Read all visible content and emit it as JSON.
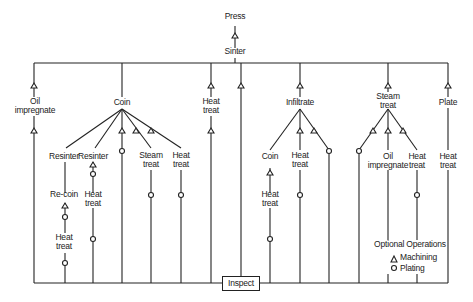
{
  "diagram": {
    "start": {
      "press": "Press",
      "sinter": "Sinter"
    },
    "end": {
      "inspect": "Inspect"
    },
    "branches": {
      "oil_impregnate": {
        "label": "Oil impregnate",
        "l1": "Oil",
        "l2": "impregnate"
      },
      "coin": {
        "label": "Coin",
        "sub": {
          "resinter_a": "Resinter",
          "recoin": "Re-coin",
          "heat_a_l1": "Heat",
          "heat_a_l2": "treat",
          "resinter_b": "Resinter",
          "heat_b_l1": "Heat",
          "heat_b_l2": "treat",
          "steam_l1": "Steam",
          "steam_l2": "treat",
          "heat_c_l1": "Heat",
          "heat_c_l2": "treat"
        }
      },
      "heat_treat": {
        "l1": "Heat",
        "l2": "treat"
      },
      "infiltrate": {
        "label": "Infiltrate",
        "sub": {
          "coin": "Coin",
          "heat_a_l1": "Heat",
          "heat_a_l2": "treat",
          "heat_b_l1": "Heat",
          "heat_b_l2": "treat"
        }
      },
      "steam_treat": {
        "l1": "Steam",
        "l2": "treat",
        "sub": {
          "oil_l1": "Oil",
          "oil_l2": "impregnate",
          "heat_l1": "Heat",
          "heat_l2": "treat"
        }
      },
      "plate": {
        "label": "Plate",
        "heat_l1": "Heat",
        "heat_l2": "treat"
      }
    },
    "legend": {
      "title": "Optional Operations",
      "machining": "Machining",
      "plating": "Plating",
      "machining_symbol": "triangle",
      "plating_symbol": "circle"
    },
    "colors": {
      "line": "#222222",
      "background": "#ffffff"
    }
  }
}
